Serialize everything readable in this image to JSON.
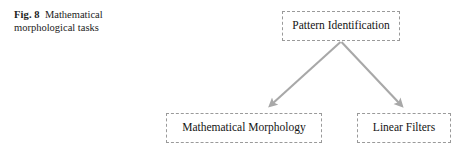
{
  "figure": {
    "caption_label": "Fig. 8",
    "caption_text": "Mathematical morphological tasks"
  },
  "diagram": {
    "type": "flowchart",
    "orientation": "top-down",
    "node_border_style": "dashed",
    "node_border_color": "#9a9a9a",
    "arrow_color": "#a8a8a8",
    "text_color": "#141414",
    "background_color": "#ffffff",
    "nodes": [
      {
        "id": "pattern-identification",
        "label": "Pattern Identification",
        "level": 0
      },
      {
        "id": "mathematical-morphology",
        "label": "Mathematical Morphology",
        "level": 1
      },
      {
        "id": "linear-filters",
        "label": "Linear Filters",
        "level": 1
      }
    ],
    "edges": [
      {
        "id": "edge-pattern-to-morphology",
        "from": "pattern-identification",
        "to": "mathematical-morphology",
        "arrowhead": "end"
      },
      {
        "id": "edge-pattern-to-filters",
        "from": "pattern-identification",
        "to": "linear-filters",
        "arrowhead": "end"
      }
    ]
  }
}
